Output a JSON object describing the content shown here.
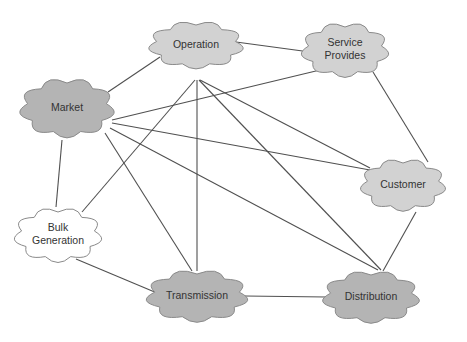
{
  "diagram": {
    "type": "network",
    "nodes": [
      {
        "id": "operation",
        "label_lines": [
          "Operation"
        ],
        "x": 196,
        "y": 45,
        "w": 92,
        "h": 52,
        "fill": "#d2d2d2"
      },
      {
        "id": "service",
        "label_lines": [
          "Service",
          "Provides"
        ],
        "x": 345,
        "y": 50,
        "w": 86,
        "h": 58,
        "fill": "#d2d2d2"
      },
      {
        "id": "market",
        "label_lines": [
          "Market"
        ],
        "x": 67,
        "y": 108,
        "w": 92,
        "h": 62,
        "fill": "#b4b4b4"
      },
      {
        "id": "customer",
        "label_lines": [
          "Customer"
        ],
        "x": 403,
        "y": 185,
        "w": 84,
        "h": 56,
        "fill": "#d2d2d2"
      },
      {
        "id": "bulk",
        "label_lines": [
          "Bulk",
          "Generation"
        ],
        "x": 58,
        "y": 235,
        "w": 86,
        "h": 58,
        "fill": "#ffffff"
      },
      {
        "id": "transmission",
        "label_lines": [
          "Transmission"
        ],
        "x": 197,
        "y": 296,
        "w": 98,
        "h": 56,
        "fill": "#b4b4b4"
      },
      {
        "id": "distribution",
        "label_lines": [
          "Distribution"
        ],
        "x": 371,
        "y": 297,
        "w": 94,
        "h": 56,
        "fill": "#b4b4b4"
      }
    ],
    "edges": [
      {
        "from": "operation",
        "to": "service",
        "x1": 236,
        "y1": 42,
        "x2": 310,
        "y2": 52
      },
      {
        "from": "market",
        "to": "operation",
        "x1": 108,
        "y1": 92,
        "x2": 160,
        "y2": 57
      },
      {
        "from": "market",
        "to": "service",
        "x1": 112,
        "y1": 120,
        "x2": 320,
        "y2": 70
      },
      {
        "from": "market",
        "to": "customer",
        "x1": 112,
        "y1": 123,
        "x2": 370,
        "y2": 170
      },
      {
        "from": "market",
        "to": "bulk",
        "x1": 62,
        "y1": 140,
        "x2": 56,
        "y2": 207
      },
      {
        "from": "market",
        "to": "transmission",
        "x1": 105,
        "y1": 133,
        "x2": 192,
        "y2": 271
      },
      {
        "from": "market",
        "to": "distribution",
        "x1": 110,
        "y1": 128,
        "x2": 378,
        "y2": 270
      },
      {
        "from": "operation",
        "to": "transmission",
        "x1": 197,
        "y1": 80,
        "x2": 197,
        "y2": 271
      },
      {
        "from": "operation",
        "to": "distribution",
        "x1": 199,
        "y1": 80,
        "x2": 381,
        "y2": 270
      },
      {
        "from": "operation",
        "to": "customer",
        "x1": 200,
        "y1": 80,
        "x2": 370,
        "y2": 168
      },
      {
        "from": "operation",
        "to": "bulk",
        "x1": 195,
        "y1": 80,
        "x2": 82,
        "y2": 212
      },
      {
        "from": "service",
        "to": "customer",
        "x1": 373,
        "y1": 72,
        "x2": 428,
        "y2": 162
      },
      {
        "from": "customer",
        "to": "distribution",
        "x1": 416,
        "y1": 212,
        "x2": 383,
        "y2": 271
      },
      {
        "from": "bulk",
        "to": "transmission",
        "x1": 76,
        "y1": 259,
        "x2": 157,
        "y2": 293
      },
      {
        "from": "transmission",
        "to": "distribution",
        "x1": 245,
        "y1": 296,
        "x2": 326,
        "y2": 297
      }
    ],
    "colors": {
      "dark_node": "#b4b4b4",
      "light_node": "#d2d2d2",
      "white_node": "#ffffff",
      "edge": "#505050",
      "outline": "#8a8a8a",
      "text": "#333333"
    }
  }
}
